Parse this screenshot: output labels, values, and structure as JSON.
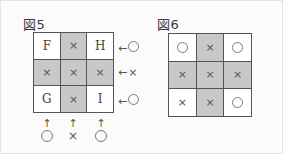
{
  "figures": [
    {
      "caption": "図5",
      "grid": [
        [
          {
            "text": "F",
            "glyph": "letter",
            "shaded": false
          },
          {
            "text": "×",
            "glyph": "x",
            "shaded": true
          },
          {
            "text": "H",
            "glyph": "letter",
            "shaded": false
          }
        ],
        [
          {
            "text": "×",
            "glyph": "x",
            "shaded": true
          },
          {
            "text": "×",
            "glyph": "x",
            "shaded": true
          },
          {
            "text": "×",
            "glyph": "x",
            "shaded": true
          }
        ],
        [
          {
            "text": "G",
            "glyph": "letter",
            "shaded": false
          },
          {
            "text": "×",
            "glyph": "x",
            "shaded": true
          },
          {
            "text": "I",
            "glyph": "letter",
            "shaded": false
          }
        ]
      ],
      "row_labels": [
        {
          "arrow": "←",
          "glyph": "o",
          "text": "○"
        },
        {
          "arrow": "←",
          "glyph": "x",
          "text": "×"
        },
        {
          "arrow": "←",
          "glyph": "o",
          "text": "○"
        }
      ],
      "col_labels": [
        {
          "arrow": "↑",
          "glyph": "o",
          "text": "○"
        },
        {
          "arrow": "↑",
          "glyph": "x",
          "text": "×"
        },
        {
          "arrow": "↑",
          "glyph": "o",
          "text": "○"
        }
      ]
    },
    {
      "caption": "図6",
      "grid": [
        [
          {
            "text": "○",
            "glyph": "o",
            "shaded": false
          },
          {
            "text": "×",
            "glyph": "x",
            "shaded": true
          },
          {
            "text": "○",
            "glyph": "o",
            "shaded": false
          }
        ],
        [
          {
            "text": "×",
            "glyph": "x",
            "shaded": true
          },
          {
            "text": "×",
            "glyph": "x",
            "shaded": true
          },
          {
            "text": "×",
            "glyph": "x",
            "shaded": true
          }
        ],
        [
          {
            "text": "×",
            "glyph": "x",
            "shaded": false
          },
          {
            "text": "×",
            "glyph": "x",
            "shaded": true
          },
          {
            "text": "○",
            "glyph": "o",
            "shaded": false
          }
        ]
      ],
      "row_labels": [],
      "col_labels": []
    }
  ],
  "colors": {
    "shaded_cell": "#c8c8c8",
    "empty_cell": "#ffffff",
    "grid_line": "#555555",
    "text": "#444444",
    "background": "#fbfbfb"
  }
}
